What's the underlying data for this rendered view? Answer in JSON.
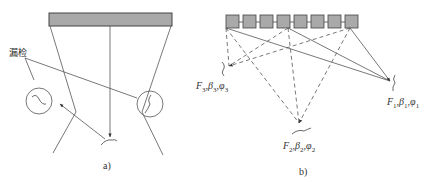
{
  "diagram": {
    "panel_a": {
      "caption": "a)",
      "missed_detection_label": "漏检",
      "elements": [
        "probe-bar",
        "beam-fan",
        "normal-beam",
        "reflected-arrow",
        "defect-circle-left",
        "defect-circle-right",
        "crack-bottom"
      ]
    },
    "panel_b": {
      "caption": "b)",
      "array_element_count": 8,
      "focal_points": [
        {
          "id": "3",
          "F": "F",
          "beta": "β",
          "phi": "φ",
          "sub": "3"
        },
        {
          "id": "2",
          "F": "F",
          "beta": "β",
          "phi": "φ",
          "sub": "2"
        },
        {
          "id": "1",
          "F": "F",
          "beta": "β",
          "phi": "φ",
          "sub": "1"
        }
      ]
    },
    "colors": {
      "probe_fill": "#a9a9a9",
      "line": "#555555",
      "background": "#ffffff"
    }
  }
}
